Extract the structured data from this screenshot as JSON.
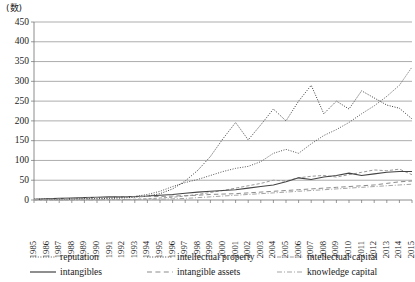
{
  "chart": {
    "unit_label": "(数)",
    "ylabel": "",
    "xlabel": ""
  },
  "legend": {
    "items": [
      {
        "label": "reputation",
        "style": "dotted",
        "color": "#555555"
      },
      {
        "label": "intellectual property",
        "style": "dotted",
        "color": "#3a3a3a"
      },
      {
        "label": "intellectual capital",
        "style": "dashed",
        "color": "#9a9a9a"
      },
      {
        "label": "intangibles",
        "style": "solid",
        "color": "#444444"
      },
      {
        "label": "intangible assets",
        "style": "longdash",
        "color": "#8c8c8c"
      },
      {
        "label": "knowledge capital",
        "style": "dashdot",
        "color": "#a5a5a5"
      }
    ]
  },
  "chart_data": {
    "type": "line",
    "title": "",
    "xlabel": "",
    "ylabel": "(数)",
    "ylim": [
      0,
      450
    ],
    "ytick_step": 50,
    "yticks": [
      0,
      50,
      100,
      150,
      200,
      250,
      300,
      350,
      400,
      450
    ],
    "grid": true,
    "legend_position": "bottom",
    "x": [
      1985,
      1986,
      1987,
      1988,
      1989,
      1990,
      1991,
      1992,
      1993,
      1994,
      1995,
      1996,
      1997,
      1998,
      1999,
      2000,
      2001,
      2002,
      2003,
      2004,
      2005,
      2006,
      2007,
      2008,
      2009,
      2010,
      2011,
      2012,
      2013,
      2014,
      2015
    ],
    "categories": [
      "1985",
      "1986",
      "1987",
      "1988",
      "1989",
      "1990",
      "1991",
      "1992",
      "1993",
      "1994",
      "1995",
      "1996",
      "1997",
      "1998",
      "1999",
      "2000",
      "2001",
      "2002",
      "2003",
      "2004",
      "2005",
      "2006",
      "2007",
      "2008",
      "2009",
      "2010",
      "2011",
      "2012",
      "2013",
      "2014",
      "2015"
    ],
    "series": [
      {
        "name": "reputation",
        "style": "dotted",
        "color": "#555555",
        "values": [
          2,
          3,
          3,
          4,
          4,
          5,
          6,
          7,
          9,
          14,
          22,
          34,
          44,
          52,
          62,
          72,
          80,
          85,
          97,
          118,
          128,
          118,
          142,
          163,
          178,
          196,
          218,
          238,
          262,
          290,
          336
        ]
      },
      {
        "name": "intellectual property",
        "style": "dotted",
        "color": "#3a3a3a",
        "values": [
          1,
          2,
          2,
          2,
          3,
          3,
          4,
          5,
          7,
          10,
          16,
          28,
          48,
          75,
          110,
          155,
          196,
          152,
          190,
          230,
          200,
          250,
          290,
          218,
          250,
          230,
          276,
          258,
          240,
          232,
          205
        ]
      },
      {
        "name": "intellectual capital",
        "style": "dashed",
        "color": "#9a9a9a",
        "values": [
          0,
          0,
          0,
          0,
          1,
          1,
          1,
          1,
          2,
          3,
          5,
          7,
          10,
          14,
          19,
          24,
          30,
          36,
          42,
          50,
          48,
          56,
          60,
          62,
          58,
          64,
          70,
          76,
          74,
          78,
          64
        ]
      },
      {
        "name": "intangibles",
        "style": "solid",
        "color": "#444444",
        "values": [
          2,
          3,
          4,
          5,
          6,
          7,
          8,
          8,
          9,
          10,
          12,
          14,
          17,
          20,
          22,
          24,
          26,
          30,
          34,
          38,
          46,
          56,
          52,
          58,
          62,
          68,
          62,
          66,
          70,
          72,
          72
        ]
      },
      {
        "name": "intangible assets",
        "style": "longdash",
        "color": "#8c8c8c",
        "values": [
          1,
          2,
          3,
          4,
          5,
          6,
          7,
          8,
          8,
          9,
          9,
          10,
          11,
          12,
          14,
          15,
          16,
          18,
          20,
          22,
          24,
          26,
          28,
          30,
          32,
          34,
          36,
          38,
          42,
          46,
          48
        ]
      },
      {
        "name": "knowledge capital",
        "style": "dashdot",
        "color": "#a5a5a5",
        "values": [
          0,
          0,
          0,
          0,
          0,
          0,
          1,
          1,
          1,
          2,
          2,
          3,
          4,
          6,
          8,
          10,
          12,
          14,
          16,
          18,
          20,
          22,
          24,
          26,
          28,
          30,
          32,
          34,
          36,
          38,
          40
        ]
      }
    ]
  }
}
